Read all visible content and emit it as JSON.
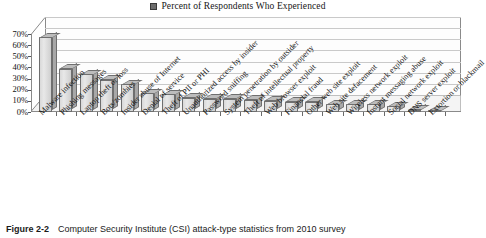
{
  "legend": {
    "marker_icon": "legend-swatch-icon",
    "label": "Percent of Respondents Who Experienced",
    "marker_color": "#6d6d6d"
  },
  "caption": {
    "figure_number": "Figure 2-2",
    "text": "Computer Security Institute (CSI) attack-type statistics from 2010 survey"
  },
  "chart_data": {
    "type": "bar",
    "title": "",
    "subtitle": "",
    "xlabel": "",
    "ylabel": "",
    "ylim": [
      0,
      70
    ],
    "ytick_labels": [
      "0%",
      "10%",
      "20%",
      "30%",
      "40%",
      "50%",
      "60%",
      "70%"
    ],
    "ytick_values": [
      0,
      10,
      20,
      30,
      40,
      50,
      60,
      70
    ],
    "grid": true,
    "legend_position": "top-center",
    "series_name": "Percent of Respondents Who Experienced",
    "categories": [
      "Malware infection",
      "Phishing messages",
      "Laptop theft or loss",
      "Bots/zombies",
      "Insider abuse of Internet",
      "Denial of service",
      "Theft of PII or PHI",
      "Unauthorized access by insider",
      "Password sniffing",
      "System penetration by outsider",
      "Theft of intellectual property",
      "Web browser exploit",
      "Financial fraud",
      "Other web site exploit",
      "Web site defacement",
      "Wireless network exploit",
      "Instant messaging abuse",
      "Social network exploit",
      "DNS server exploit",
      "Extortion or blackmail"
    ],
    "values": [
      67,
      39,
      34,
      29,
      25,
      17,
      16,
      13,
      12,
      12,
      11,
      10,
      9,
      9,
      7,
      7,
      7,
      5,
      2,
      1
    ]
  }
}
